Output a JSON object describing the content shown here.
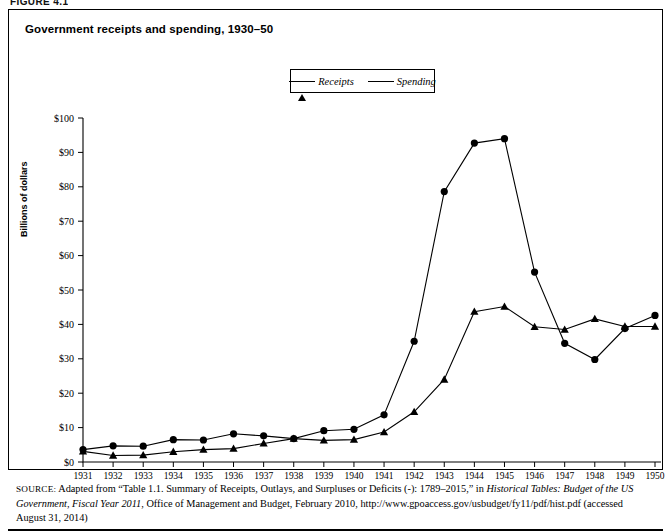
{
  "figure": {
    "number_label": "FIGURE 4.1",
    "title": "Government receipts and spending, 1930–50"
  },
  "legend": {
    "position": "top-center",
    "entries": [
      {
        "label": "Receipts",
        "marker": "triangle-marker"
      },
      {
        "label": "Spending",
        "marker": "circle-marker"
      }
    ]
  },
  "axes": {
    "y_title": "Billions of dollars",
    "y_ticks": [
      "$0",
      "$10",
      "$20",
      "$30",
      "$40",
      "$50",
      "$60",
      "$70",
      "$80",
      "$90",
      "$100"
    ],
    "x_ticks": [
      "1931",
      "1932",
      "1933",
      "1934",
      "1935",
      "1936",
      "1937",
      "1938",
      "1939",
      "1940",
      "1941",
      "1942",
      "1943",
      "1944",
      "1945",
      "1946",
      "1947",
      "1948",
      "1949",
      "1950"
    ]
  },
  "source": {
    "kicker": "SOURCE:",
    "text_1": " Adapted from “Table 1.1. Summary of Receipts, Outlays, and Surpluses or Deficits (-): 1789–2015,” in ",
    "italic_1": "Historical Tables: Budget of the US Government, Fiscal Year 2011",
    "text_2": ", Office of Management and Budget, February 2010, http://www.gpoaccess.gov/usbudget/fy11/pdf/hist.pdf (accessed August 31, 2014)"
  },
  "chart_data": {
    "type": "line",
    "title": "Government receipts and spending, 1930–50",
    "xlabel": "",
    "ylabel": "Billions of dollars",
    "xlim": [
      1931,
      1950
    ],
    "ylim": [
      0,
      100
    ],
    "ytick_step": 10,
    "grid": false,
    "legend_position": "top-center",
    "categories": [
      1931,
      1932,
      1933,
      1934,
      1935,
      1936,
      1937,
      1938,
      1939,
      1940,
      1941,
      1942,
      1943,
      1944,
      1945,
      1946,
      1947,
      1948,
      1949,
      1950
    ],
    "series": [
      {
        "name": "Receipts",
        "marker": "triangle",
        "values": [
          3.1,
          1.9,
          2.0,
          3.0,
          3.6,
          3.9,
          5.4,
          6.8,
          6.3,
          6.5,
          8.7,
          14.6,
          24.0,
          43.7,
          45.2,
          39.3,
          38.5,
          41.6,
          39.4,
          39.4
        ]
      },
      {
        "name": "Spending",
        "marker": "circle",
        "values": [
          3.6,
          4.7,
          4.6,
          6.5,
          6.4,
          8.2,
          7.6,
          6.8,
          9.1,
          9.5,
          13.7,
          35.1,
          78.6,
          92.7,
          94.0,
          55.2,
          34.5,
          29.8,
          38.8,
          42.6
        ]
      }
    ]
  }
}
